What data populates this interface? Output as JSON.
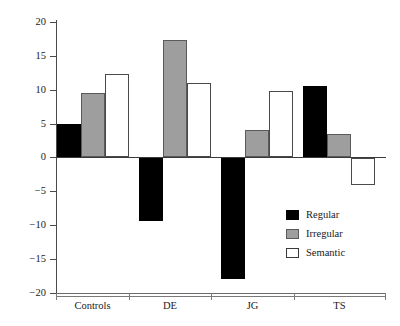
{
  "chart_data": {
    "type": "bar",
    "title": "",
    "xlabel": "",
    "ylabel": "Proportion of priming",
    "categories": [
      "Controls",
      "DE",
      "JG",
      "TS"
    ],
    "series": [
      {
        "name": "Regular",
        "color": "#000000",
        "values": [
          5.0,
          -9.3,
          -18.0,
          10.5
        ]
      },
      {
        "name": "Irregular",
        "color": "#9e9e9e",
        "values": [
          9.5,
          17.4,
          4.0,
          3.4
        ]
      },
      {
        "name": "Semantic",
        "color": "#ffffff",
        "values": [
          12.3,
          11.0,
          9.8,
          -4.0
        ]
      }
    ],
    "ylim": [
      -20,
      20
    ],
    "yticks": [
      20,
      15,
      10,
      5,
      0,
      -5,
      -10,
      -15,
      -20
    ],
    "ytick_labels": [
      "20",
      "15",
      "10",
      "5",
      "0",
      "−5",
      "−10",
      "−15",
      "−20"
    ],
    "grid": false,
    "legend_position": "inside-lower-right",
    "zero_line": true
  },
  "axis": {
    "y_title": "Proportion of priming",
    "tick_0": "0",
    "tick_5": "5",
    "tick_10": "10",
    "tick_15": "15",
    "tick_20": "20",
    "tick_m5": "−5",
    "tick_m10": "−10",
    "tick_m15": "−15",
    "tick_m20": "−20"
  },
  "categories": {
    "c0": "Controls",
    "c1": "DE",
    "c2": "JG",
    "c3": "TS"
  },
  "legend": {
    "items": [
      {
        "label": "Regular",
        "swatch": "black-filled-square"
      },
      {
        "label": "Irregular",
        "swatch": "gray-filled-square"
      },
      {
        "label": "Semantic",
        "swatch": "white-outlined-square"
      }
    ]
  }
}
